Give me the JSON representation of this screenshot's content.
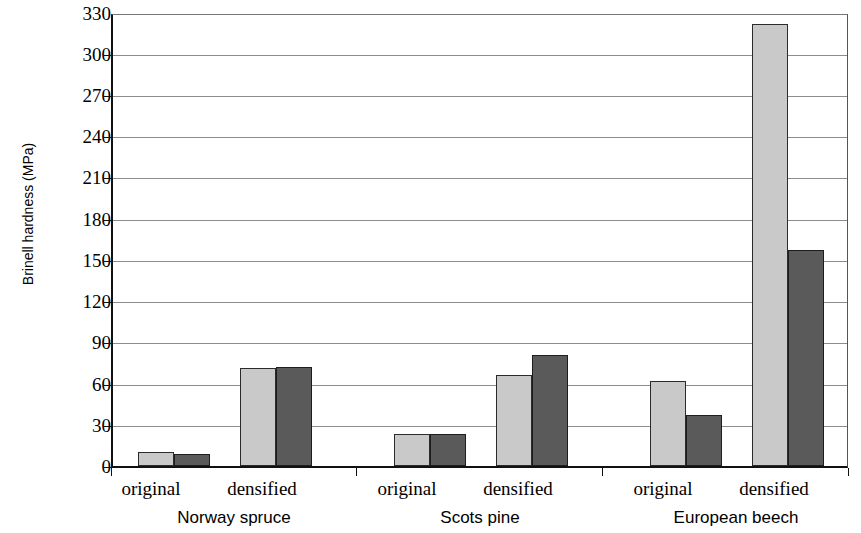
{
  "chart_data": {
    "type": "bar",
    "title": "",
    "subtitle": "",
    "xlabel": "",
    "ylabel": "Brinell hardness (MPa)",
    "ylim": [
      0,
      330
    ],
    "ytick_labels": [
      "0",
      "30",
      "60",
      "90",
      "120",
      "150",
      "180",
      "210",
      "240",
      "270",
      "300",
      "330"
    ],
    "ytick_values": [
      0,
      30,
      60,
      90,
      120,
      150,
      180,
      210,
      240,
      270,
      300,
      330
    ],
    "grid": true,
    "legend": null,
    "legend_position": "none",
    "groups": [
      "Norway spruce",
      "Scots pine",
      "European beech"
    ],
    "categories": [
      "original",
      "densified",
      "original",
      "densified",
      "original",
      "densified"
    ],
    "series": [
      {
        "name": "series-light",
        "color": "#c9c9c9",
        "values": [
          10,
          71,
          23,
          66,
          62,
          321
        ]
      },
      {
        "name": "series-dark",
        "color": "#5a5a5a",
        "values": [
          9,
          72,
          23,
          81,
          37,
          157
        ]
      }
    ],
    "bars": [
      {
        "group": "Norway spruce",
        "treatment": "original",
        "light": 10,
        "dark": 9
      },
      {
        "group": "Norway spruce",
        "treatment": "densified",
        "light": 71,
        "dark": 72
      },
      {
        "group": "Scots pine",
        "treatment": "original",
        "light": 23,
        "dark": 23
      },
      {
        "group": "Scots pine",
        "treatment": "densified",
        "light": 66,
        "dark": 81
      },
      {
        "group": "European beech",
        "treatment": "original",
        "light": 62,
        "dark": 37
      },
      {
        "group": "European beech",
        "treatment": "densified",
        "light": 321,
        "dark": 157
      }
    ],
    "axis_colors": {
      "axis": "#111111",
      "grid": "#8d8d8d",
      "bar_light": "#c9c9c9",
      "bar_dark": "#5a5a5a",
      "bar_outline": "#2b2b2b"
    }
  },
  "ytick": {
    "t0": "0",
    "t1": "30",
    "t2": "60",
    "t3": "90",
    "t4": "120",
    "t5": "150",
    "t6": "180",
    "t7": "210",
    "t8": "240",
    "t9": "270",
    "t10": "300",
    "t11": "330"
  },
  "treatments": {
    "spruce_original": "original",
    "spruce_densified": "densified",
    "pine_original": "original",
    "pine_densified": "densified",
    "beech_original": "original",
    "beech_densified": "densified"
  },
  "groups": {
    "g0": "Norway spruce",
    "g1": "Scots pine",
    "g2": "European beech"
  }
}
